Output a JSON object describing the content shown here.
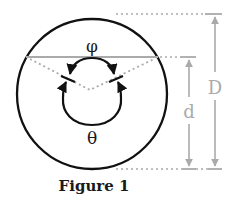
{
  "figure": {
    "caption": "Figure 1",
    "labels": {
      "phi": "φ",
      "theta": "θ",
      "d": "d",
      "D": "D"
    },
    "colors": {
      "outline": "#111111",
      "guide": "#aaaaaa",
      "text": "#1a1a1a",
      "dimension_text": "#aaaaaa"
    }
  }
}
